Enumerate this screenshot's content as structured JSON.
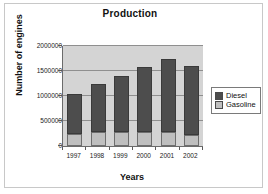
{
  "chart_data": {
    "type": "bar",
    "subtype": "stacked-column",
    "title": "Production",
    "xlabel": "Years",
    "ylabel": "Number of engines",
    "categories": [
      "1997",
      "1998",
      "1999",
      "2000",
      "2001",
      "2002"
    ],
    "series": [
      {
        "name": "Gasoline",
        "color": "#bfbfbf",
        "values": [
          250000,
          280000,
          275000,
          290000,
          280000,
          230000
        ]
      },
      {
        "name": "Diesel",
        "color": "#4d4d4d",
        "values": [
          800000,
          960000,
          1125000,
          1300000,
          1470000,
          1370000
        ]
      }
    ],
    "totals": [
      1050000,
      1240000,
      1400000,
      1590000,
      1750000,
      1600000
    ],
    "ylim": [
      0,
      2000000
    ],
    "yticks": [
      0,
      500000,
      1000000,
      1500000,
      2000000
    ],
    "ytick_labels": [
      "0",
      "500000",
      "1000000",
      "1500000",
      "2000000"
    ],
    "grid": true,
    "grid_axis": "y",
    "legend_position": "right",
    "plot_background": "#d4d4d4",
    "page_background": "#ffffff"
  },
  "legend": {
    "items": [
      {
        "label": "Diesel",
        "color": "#4d4d4d"
      },
      {
        "label": "Gasoline",
        "color": "#bfbfbf"
      }
    ]
  }
}
